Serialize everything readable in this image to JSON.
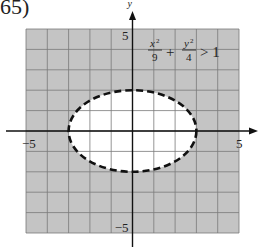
{
  "problem": {
    "number": "65)"
  },
  "chart_data": {
    "type": "region",
    "title": "",
    "inequality": "x^2/9 + y^2/4 > 1",
    "inequality_label": {
      "x_num": "x",
      "x_den": "9",
      "plus": "+",
      "y_num": "y",
      "y_den": "4",
      "rel": "> 1"
    },
    "xlabel": "",
    "ylabel": "y",
    "xlim": [
      -5,
      5
    ],
    "ylim": [
      -5,
      5
    ],
    "grid": true,
    "grid_step": 1,
    "x_tick_labels": [
      {
        "value": -5,
        "text": "−5"
      },
      {
        "value": 5,
        "text": "5"
      }
    ],
    "y_tick_labels": [
      {
        "value": 5,
        "text": "5"
      },
      {
        "value": -5,
        "text": "−5"
      }
    ],
    "boundary": {
      "shape": "ellipse",
      "center": [
        0,
        0
      ],
      "a": 3,
      "b": 2,
      "style": "dashed"
    },
    "shaded_region": "outside ellipse",
    "colors": {
      "shade": "#c4c4c4",
      "grid": "#7a7a7a",
      "axis": "#111111",
      "boundary": "#111111",
      "interior": "#ffffff"
    }
  }
}
